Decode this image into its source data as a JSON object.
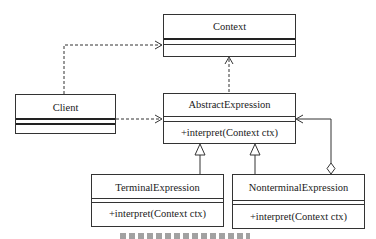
{
  "diagram": {
    "type": "uml-class-diagram",
    "classes": {
      "context": {
        "name": "Context",
        "operations": []
      },
      "client": {
        "name": "Client",
        "operations": []
      },
      "abstract_expression": {
        "name": "AbstractExpression",
        "operations": [
          "+interpret(Context ctx)"
        ]
      },
      "terminal_expression": {
        "name": "TerminalExpression",
        "operations": [
          "+interpret(Context ctx)"
        ]
      },
      "nonterminal_expression": {
        "name": "NonterminalExpression",
        "operations": [
          "+interpret(Context ctx)"
        ]
      }
    },
    "relationships": [
      {
        "from": "Client",
        "to": "Context",
        "kind": "dependency",
        "style": "dashed-open-arrow"
      },
      {
        "from": "Client",
        "to": "AbstractExpression",
        "kind": "dependency",
        "style": "dashed-open-arrow"
      },
      {
        "from": "AbstractExpression",
        "to": "Context",
        "kind": "dependency",
        "style": "dashed-open-arrow"
      },
      {
        "from": "TerminalExpression",
        "to": "AbstractExpression",
        "kind": "generalization",
        "style": "hollow-triangle"
      },
      {
        "from": "NonterminalExpression",
        "to": "AbstractExpression",
        "kind": "generalization",
        "style": "hollow-triangle"
      },
      {
        "from": "NonterminalExpression",
        "to": "AbstractExpression",
        "kind": "aggregation",
        "style": "hollow-diamond-open-arrow"
      }
    ]
  }
}
